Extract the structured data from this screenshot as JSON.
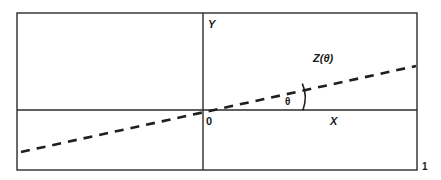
{
  "figure": {
    "number": "1",
    "frame": {
      "x": 17,
      "y": 13,
      "width": 400,
      "height": 157,
      "stroke": "#2b2b2b",
      "stroke_width": 1.4
    },
    "axes": {
      "x_axis": {
        "label": "X",
        "y": 110,
        "x1": 17,
        "x2": 417,
        "stroke": "#2b2b2b"
      },
      "y_axis": {
        "label": "Y",
        "x": 203,
        "y1": 13,
        "y2": 170,
        "stroke": "#2b2b2b"
      },
      "origin_label": "0"
    },
    "line": {
      "label": "Z(θ)",
      "style": "dashed",
      "x1": 21,
      "y1": 152,
      "x2": 416,
      "y2": 66,
      "stroke": "#1f1f1f",
      "stroke_width": 2.6,
      "dash": "9 7"
    },
    "angle": {
      "label": "θ",
      "arc_center_x": 203,
      "arc_center_y": 110,
      "arc_radius": 100,
      "stroke": "#1f1f1f"
    },
    "colors": {
      "background": "#ffffff",
      "ink": "#2b2b2b",
      "line": "#1f1f1f"
    }
  }
}
